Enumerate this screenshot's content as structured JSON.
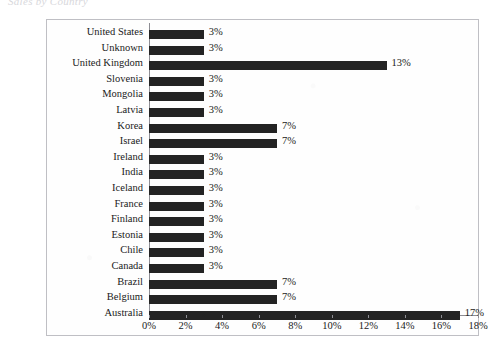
{
  "document": {
    "faint_title": "Sales by Country"
  },
  "axis": {
    "x_ticks": [
      "0%",
      "2%",
      "4%",
      "6%",
      "8%",
      "10%",
      "12%",
      "14%",
      "16%",
      "18%"
    ],
    "x_min": 0,
    "x_max": 18
  },
  "colors": {
    "bar": "#232323",
    "frame": "#bfbfc4",
    "axis": "#8d8d93",
    "background": "#ffffff",
    "text": "#1a1a1a"
  },
  "chart_data": {
    "type": "bar",
    "orientation": "horizontal",
    "title": "Sales by Country",
    "xlabel": "",
    "ylabel": "",
    "xlim": [
      0,
      18
    ],
    "grid": false,
    "legend": false,
    "categories": [
      "United States",
      "Unknown",
      "United Kingdom",
      "Slovenia",
      "Mongolia",
      "Latvia",
      "Korea",
      "Israel",
      "Ireland",
      "India",
      "Iceland",
      "France",
      "Finland",
      "Estonia",
      "Chile",
      "Canada",
      "Brazil",
      "Belgium",
      "Australia"
    ],
    "values": [
      3,
      3,
      13,
      3,
      3,
      3,
      7,
      7,
      3,
      3,
      3,
      3,
      3,
      3,
      3,
      3,
      7,
      7,
      17
    ],
    "value_labels": [
      "3%",
      "3%",
      "13%",
      "3%",
      "3%",
      "3%",
      "7%",
      "7%",
      "3%",
      "3%",
      "3%",
      "3%",
      "3%",
      "3%",
      "3%",
      "3%",
      "7%",
      "7%",
      "17%"
    ],
    "tick_labels": [
      "0%",
      "2%",
      "4%",
      "6%",
      "8%",
      "10%",
      "12%",
      "14%",
      "16%",
      "18%"
    ]
  }
}
